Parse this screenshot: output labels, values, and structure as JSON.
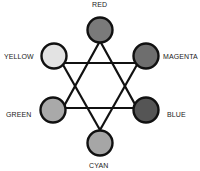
{
  "diagram": {
    "type": "color-wheel",
    "nodes": [
      {
        "id": "red",
        "label": "RED",
        "fill": "#7a7a7a"
      },
      {
        "id": "magenta",
        "label": "MAGENTA",
        "fill": "#6e6e6e"
      },
      {
        "id": "blue",
        "label": "BLUE",
        "fill": "#555555"
      },
      {
        "id": "cyan",
        "label": "CYAN",
        "fill": "#a6a6a6"
      },
      {
        "id": "green",
        "label": "GREEN",
        "fill": "#a9a9a9"
      },
      {
        "id": "yellow",
        "label": "YELLOW",
        "fill": "#e3e3e3"
      }
    ],
    "edges": [
      [
        "red",
        "green"
      ],
      [
        "green",
        "blue"
      ],
      [
        "blue",
        "red"
      ],
      [
        "yellow",
        "magenta"
      ],
      [
        "magenta",
        "cyan"
      ],
      [
        "cyan",
        "yellow"
      ]
    ]
  }
}
